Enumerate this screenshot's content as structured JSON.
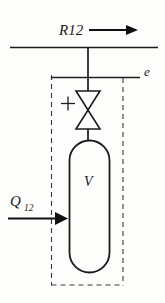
{
  "diagram": {
    "type": "engineering-schematic",
    "background_color": "#fdfdfb",
    "line_color": "#1b1b1b",
    "boundary_color": "#3a3a3a",
    "labels": {
      "supply_line": "R12",
      "exit_state": "e",
      "vessel": "V",
      "heat_input_symbol": "Q",
      "heat_input_subscript": "12",
      "valve_sign": "+"
    },
    "elements": [
      {
        "name": "supply-line",
        "kind": "horizontal-pipe",
        "label": "R12",
        "flow_direction": "right"
      },
      {
        "name": "flow-arrow-r12",
        "kind": "arrow",
        "direction": "right",
        "label": "R12"
      },
      {
        "name": "exit-line",
        "kind": "horizontal-line",
        "label": "e"
      },
      {
        "name": "valve",
        "kind": "bowtie-valve",
        "sign": "+"
      },
      {
        "name": "vessel",
        "kind": "capsule-tank",
        "label": "V"
      },
      {
        "name": "heat-arrow",
        "kind": "arrow",
        "direction": "right",
        "label": "Q12"
      },
      {
        "name": "control-volume-boundary",
        "kind": "dashed-rectangle"
      }
    ]
  }
}
